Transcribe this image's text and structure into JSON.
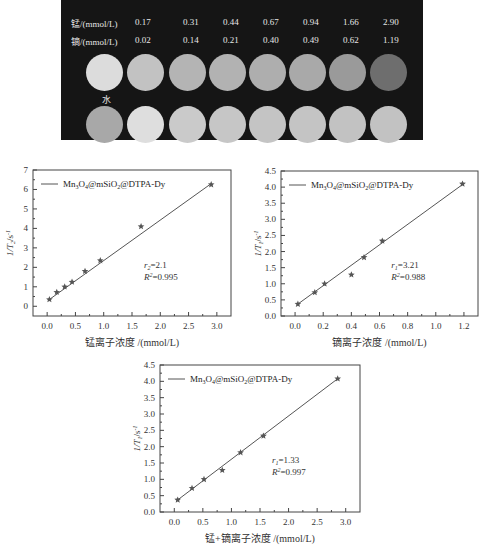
{
  "phantom": {
    "row1_label": "锰/(mmol/L)",
    "row2_label": "镝/(mmol/L)",
    "mn_values": [
      "0.17",
      "0.31",
      "0.44",
      "0.67",
      "0.94",
      "1.66",
      "2.90"
    ],
    "dy_values": [
      "0.02",
      "0.14",
      "0.21",
      "0.40",
      "0.49",
      "0.62",
      "1.19"
    ],
    "water_label": "水",
    "t1_gray": [
      "#dcdcdc",
      "#c2c2c2",
      "#b4b4b4",
      "#b2b2b2",
      "#aeaeae",
      "#a9a9a9",
      "#9a9a9a",
      "#6e6e6e"
    ],
    "t2_gray": [
      "#a8a8a8",
      "#dedede",
      "#cacaca",
      "#c6c6c6",
      "#c4c4c4",
      "#c4c4c4",
      "#c2c2c2",
      "#c2c2c2"
    ]
  },
  "chart_data": [
    {
      "type": "scatter",
      "legend": "Mn3O4@mSiO2@DTPA-Dy",
      "legend_position": "top-left",
      "xlabel": "锰离子浓度 /(mmol/L)",
      "ylabel": "1/T2/s-1",
      "xlim": [
        -0.25,
        3.25
      ],
      "ylim": [
        -0.5,
        7
      ],
      "xticks": [
        0.0,
        0.5,
        1.0,
        1.5,
        2.0,
        2.5,
        3.0
      ],
      "xtick_labels": [
        "0.0",
        "0.5",
        "1.0",
        "1.5",
        "2.0",
        "2.5",
        "3.0"
      ],
      "yticks": [
        0,
        1,
        2,
        3,
        4,
        5,
        6,
        7
      ],
      "ytick_labels": [
        "0",
        "1",
        "2",
        "3",
        "4",
        "5",
        "6",
        "7"
      ],
      "x": [
        0.04,
        0.17,
        0.31,
        0.44,
        0.67,
        0.94,
        1.66,
        2.9
      ],
      "y": [
        0.35,
        0.72,
        1.0,
        1.25,
        1.8,
        2.35,
        4.1,
        6.25
      ],
      "fit": {
        "x": [
          0.04,
          2.9
        ],
        "y": [
          0.35,
          6.3
        ]
      },
      "annotation": {
        "r_label": "r2=2.1",
        "r2_label": "R2=0.995"
      }
    },
    {
      "type": "scatter",
      "legend": "Mn3O4@mSiO2@DTPA-Dy",
      "legend_position": "top-left",
      "xlabel": "镝离子浓度 /(mmol/L)",
      "ylabel": "1/T1/s-1",
      "xlim": [
        -0.1,
        1.3
      ],
      "ylim": [
        0,
        4.5
      ],
      "xticks": [
        0.0,
        0.2,
        0.4,
        0.6,
        0.8,
        1.0,
        1.2
      ],
      "xtick_labels": [
        "0.0",
        "0.2",
        "0.4",
        "0.6",
        "0.8",
        "1.0",
        "1.2"
      ],
      "yticks": [
        0,
        0.5,
        1,
        1.5,
        2,
        2.5,
        3,
        3.5,
        4,
        4.5
      ],
      "ytick_labels": [
        "0.0",
        "0.5",
        "1.0",
        "1.5",
        "2.0",
        "2.5",
        "3.0",
        "3.5",
        "4.0",
        "4.5"
      ],
      "x": [
        0.02,
        0.14,
        0.21,
        0.4,
        0.49,
        0.62,
        1.19
      ],
      "y": [
        0.37,
        0.73,
        1.0,
        1.28,
        1.82,
        2.33,
        4.1
      ],
      "fit": {
        "x": [
          0.02,
          1.19
        ],
        "y": [
          0.37,
          4.08
        ]
      },
      "annotation": {
        "r_label": "r1=3.21",
        "r2_label": "R2=0.988"
      }
    },
    {
      "type": "scatter",
      "legend": "Mn3O4@mSiO2@DTPA-Dy",
      "legend_position": "top-left",
      "xlabel": "锰+镝离子浓度 /(mmol/L)",
      "ylabel": "1/T1/s-1",
      "xlim": [
        -0.25,
        3.25
      ],
      "ylim": [
        0,
        4.5
      ],
      "xticks": [
        0.0,
        0.5,
        1.0,
        1.5,
        2.0,
        2.5,
        3.0
      ],
      "xtick_labels": [
        "0.0",
        "0.5",
        "1.0",
        "1.5",
        "2.0",
        "2.5",
        "3.0"
      ],
      "yticks": [
        0,
        0.5,
        1,
        1.5,
        2,
        2.5,
        3,
        3.5,
        4,
        4.5
      ],
      "ytick_labels": [
        "0.0",
        "0.5",
        "1.0",
        "1.5",
        "2.0",
        "2.5",
        "3.0",
        "3.5",
        "4.0",
        "4.5"
      ],
      "x": [
        0.06,
        0.31,
        0.52,
        0.84,
        1.16,
        1.56,
        2.86
      ],
      "y": [
        0.37,
        0.73,
        1.0,
        1.28,
        1.82,
        2.33,
        4.08
      ],
      "fit": {
        "x": [
          0.06,
          2.86
        ],
        "y": [
          0.37,
          4.08
        ]
      },
      "annotation": {
        "r_label": "r1=1.33",
        "r2_label": "R2=0.997"
      }
    }
  ]
}
